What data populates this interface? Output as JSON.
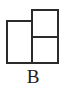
{
  "figure": {
    "caption": "B",
    "stroke_color": "#2b2b2b",
    "fill_color": "#ffffff",
    "background_color": "#ffffff",
    "caption_color": "#1c1c1c",
    "stroke_width_px": 2,
    "shape_name": "tromino-three-squares",
    "cells": [
      {
        "name": "left-square",
        "x": 6,
        "y": 20,
        "width": 27,
        "height": 44
      },
      {
        "name": "right-top-square",
        "x": 31,
        "y": 9,
        "width": 28,
        "height": 29
      },
      {
        "name": "right-bottom-square",
        "x": 31,
        "y": 36,
        "width": 28,
        "height": 28
      }
    ]
  }
}
